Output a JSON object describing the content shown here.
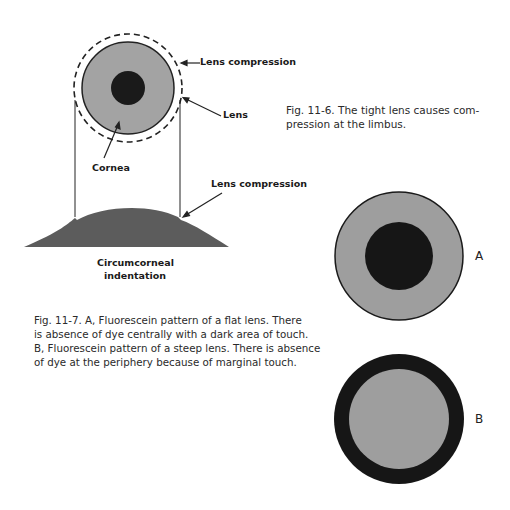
{
  "figure_11_6": {
    "labels": {
      "lens_compression_top": "Lens compression",
      "lens": "Lens",
      "cornea": "Cornea",
      "lens_compression_bottom": "Lens compression",
      "circumcorneal_line1": "Circumcorneal",
      "circumcorneal_line2": "indentation"
    },
    "caption_line1": "Fig. 11-6.   The tight lens causes com-",
    "caption_line2": "pression at the limbus."
  },
  "figure_11_7": {
    "caption_lines": [
      "Fig. 11-7.   A, Fluorescein pattern of a flat lens. There",
      "is absence of dye centrally with a dark area of touch.",
      "B, Fluorescein pattern of a steep lens. There is absence",
      "of dye at the periphery because of marginal touch."
    ],
    "panel_a_label": "A",
    "panel_b_label": "B"
  },
  "colors": {
    "gray_fill": "#9a9a9a",
    "dark_fill": "#1c1c1c",
    "mound_fill": "#5a5a5a",
    "line": "#222222"
  }
}
